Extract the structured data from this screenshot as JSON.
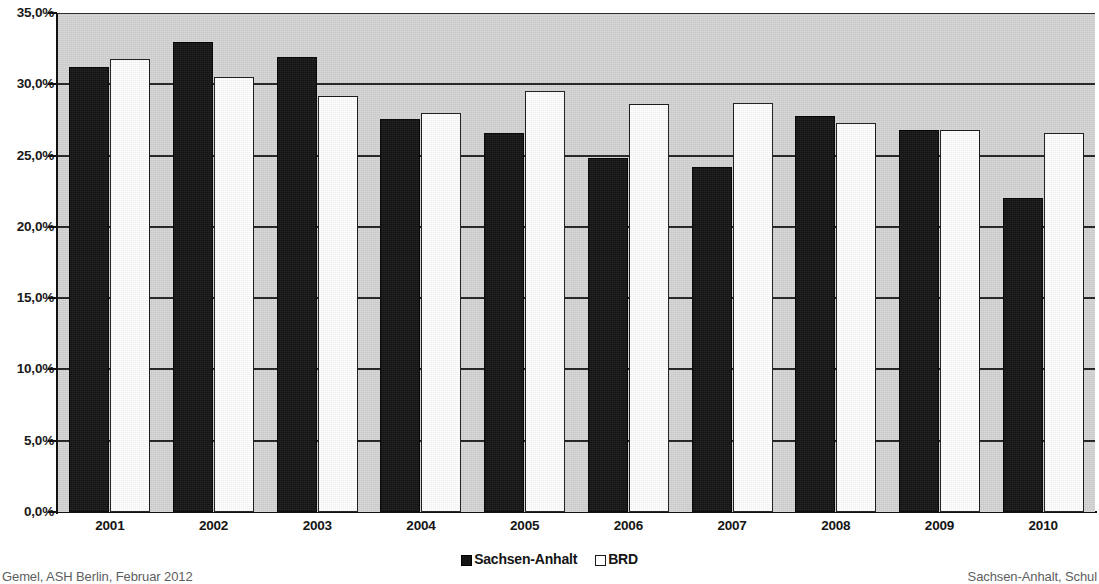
{
  "chart_data": {
    "type": "bar",
    "title": "",
    "subtitle": "",
    "xlabel": "",
    "ylabel": "",
    "categories": [
      "2001",
      "2002",
      "2003",
      "2004",
      "2005",
      "2006",
      "2007",
      "2008",
      "2009",
      "2010"
    ],
    "series": [
      {
        "name": "Sachsen-Anhalt",
        "color": "#141414",
        "values": [
          31.2,
          33.0,
          31.9,
          27.6,
          26.6,
          24.8,
          24.2,
          27.8,
          26.8,
          22.0
        ]
      },
      {
        "name": "BRD",
        "color": "#ffffff",
        "values": [
          31.8,
          30.5,
          29.2,
          28.0,
          29.5,
          28.6,
          28.7,
          27.3,
          26.8,
          26.6
        ]
      }
    ],
    "ylim": [
      0,
      35
    ],
    "ytick_values": [
      0,
      5,
      10,
      15,
      20,
      25,
      30,
      35
    ],
    "ytick_labels": [
      "0,0%",
      "5,0%",
      "10,0%",
      "15,0%",
      "20,0%",
      "25,0%",
      "30,0%",
      "35,0%"
    ],
    "grid": true,
    "grid_axis": "y",
    "legend_position": "bottom-center",
    "plot_background": "#d5d5d5",
    "axis_color": "#111111"
  },
  "legend": {
    "entries": [
      {
        "label": "Sachsen-Anhalt",
        "style": "dark"
      },
      {
        "label": "BRD",
        "style": "light"
      }
    ]
  },
  "footer": {
    "left": "Gemel, ASH Berlin, Februar 2012",
    "right": "Sachsen-Anhalt, Schul"
  }
}
